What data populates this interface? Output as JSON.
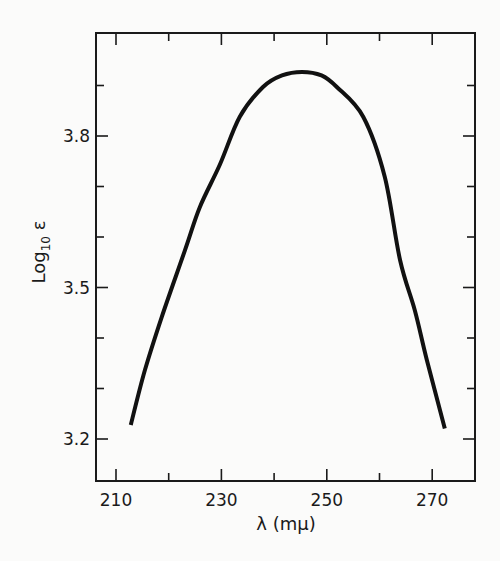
{
  "chart_data": {
    "type": "line",
    "title": "",
    "xlabel": "λ (mμ)",
    "ylabel": "Log₁₀ ε",
    "ylabel_parts": {
      "main": "Log",
      "sub": "10",
      "tail": " ε"
    },
    "xlim": [
      206,
      278
    ],
    "ylim": [
      3.13,
      4.0
    ],
    "x_ticks_major": [
      210,
      230,
      250,
      270
    ],
    "x_tick_labels": [
      "210",
      "230",
      "250",
      "270"
    ],
    "x_ticks_minor": [
      220,
      240,
      260
    ],
    "y_ticks_major": [
      3.2,
      3.5,
      3.8
    ],
    "y_tick_labels": [
      "3.2",
      "3.5",
      "3.8"
    ],
    "y_ticks_minor": [
      3.3,
      3.4,
      3.6,
      3.7,
      3.9
    ],
    "grid": false,
    "legend": null,
    "frame": "box with inward ticks on all four sides",
    "line_color": "#111111",
    "series": [
      {
        "name": "absorption spectrum",
        "x": [
          212.8,
          215.5,
          218.7,
          223.1,
          225.9,
          229.7,
          233.5,
          237.9,
          241.5,
          245.3,
          249.0,
          251.9,
          256.9,
          261.0,
          263.9,
          266.7,
          269.0,
          272.4
        ],
        "y": [
          3.228,
          3.337,
          3.442,
          3.574,
          3.659,
          3.743,
          3.838,
          3.897,
          3.92,
          3.927,
          3.92,
          3.897,
          3.838,
          3.719,
          3.554,
          3.455,
          3.356,
          3.221
        ]
      }
    ]
  }
}
